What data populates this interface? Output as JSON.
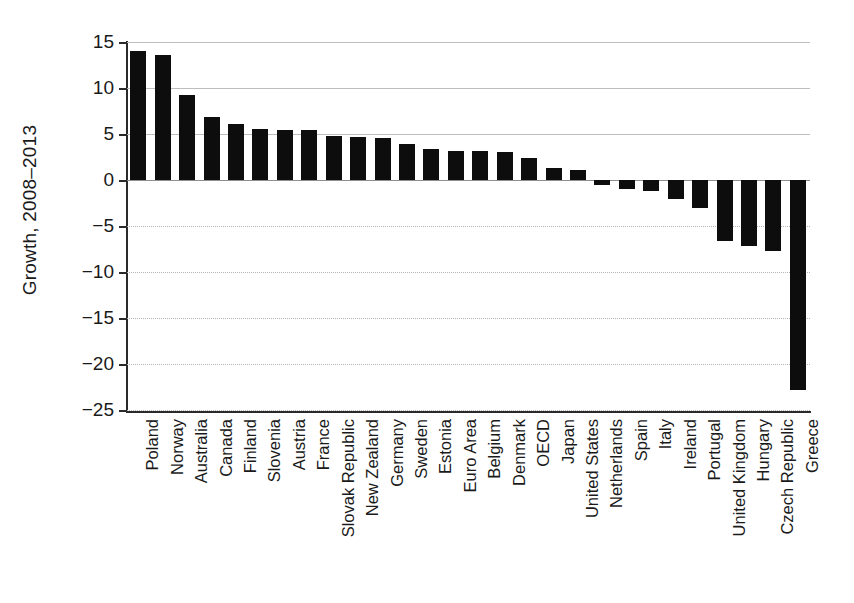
{
  "chart_data": {
    "type": "bar",
    "title": "",
    "xlabel": "",
    "ylabel": "Growth, 2008–2013",
    "ylim": [
      -25,
      15
    ],
    "yticks": [
      15,
      10,
      5,
      0,
      -5,
      -10,
      -15,
      -20,
      -25
    ],
    "ytick_labels": [
      "15",
      "10",
      "5",
      "0",
      "−5",
      "−10",
      "−15",
      "−20",
      "−25"
    ],
    "grid": true,
    "legend": false,
    "orientation": "vertical",
    "bar_color": "#0d0d0d",
    "categories": [
      "Poland",
      "Norway",
      "Australia",
      "Canada",
      "Finland",
      "Slovenia",
      "Austria",
      "France",
      "Slovak Republic",
      "New Zealand",
      "Germany",
      "Sweden",
      "Estonia",
      "Euro Area",
      "Belgium",
      "Denmark",
      "OECD",
      "Japan",
      "United States",
      "Netherlands",
      "Spain",
      "Italy",
      "Ireland",
      "Portugal",
      "United Kingdom",
      "Hungary",
      "Czech Republic",
      "Greece"
    ],
    "values": [
      14.0,
      13.6,
      9.2,
      6.9,
      6.1,
      5.5,
      5.4,
      5.4,
      4.8,
      4.7,
      4.6,
      3.9,
      3.4,
      3.2,
      3.1,
      3.0,
      2.4,
      1.3,
      1.1,
      -0.5,
      -1.0,
      -1.2,
      -2.1,
      -3.0,
      -6.6,
      -7.2,
      -7.7,
      -22.8
    ]
  }
}
